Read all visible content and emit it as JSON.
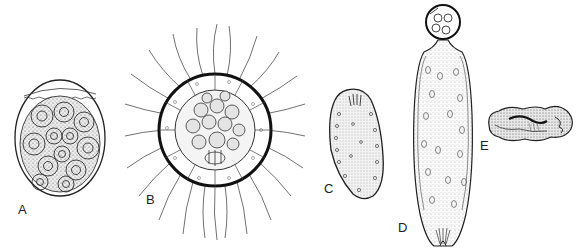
{
  "figure": {
    "type": "scientific-illustration",
    "panels": [
      {
        "id": "A",
        "label": "A",
        "subject": "ovoid cyst with enclosed multinucleate cells"
      },
      {
        "id": "B",
        "label": "B",
        "subject": "spherical colony with radiating flagella"
      },
      {
        "id": "C",
        "label": "C",
        "subject": "elongate ciliate-like cell"
      },
      {
        "id": "D",
        "label": "D",
        "subject": "elongate cell with apical spherical head"
      },
      {
        "id": "E",
        "label": "E",
        "subject": "contracted convoluted form"
      }
    ]
  },
  "colors": {
    "ink": "#1a1a1a",
    "stipple": "#555555",
    "background": "#ffffff"
  }
}
